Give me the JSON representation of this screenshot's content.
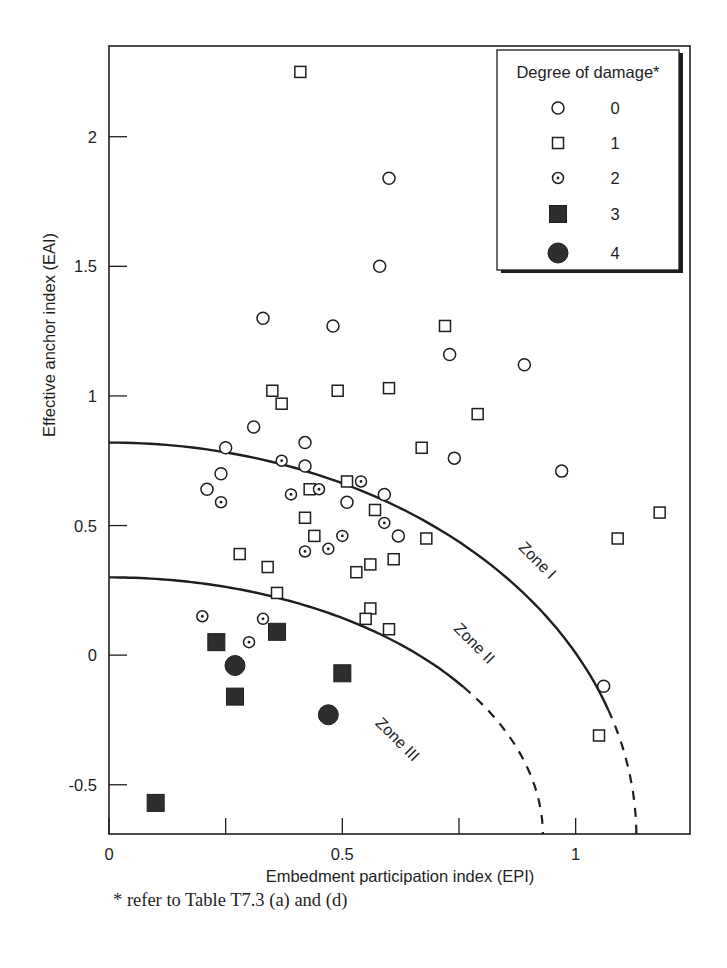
{
  "chart_data": {
    "type": "scatter",
    "title": "",
    "xlabel": "Embedment participation index (EPI)",
    "ylabel": "Effective anchor index (EAI)",
    "xlim": [
      0,
      1.245
    ],
    "ylim": [
      -0.69,
      2.35
    ],
    "xticks": [
      0,
      0.25,
      0.5,
      0.75,
      1
    ],
    "xtick_labels": [
      "0",
      "",
      "0.5",
      "",
      "1"
    ],
    "yticks": [
      -0.5,
      0,
      0.5,
      1,
      1.5,
      2
    ],
    "ytick_labels": [
      "-0.5",
      "0",
      "0.5",
      "1",
      "1.5",
      "2"
    ],
    "grid": false,
    "legend": {
      "title": "Degree of damage*",
      "placement": "top-right",
      "entries": [
        {
          "label": "0",
          "marker": "open-circle"
        },
        {
          "label": "1",
          "marker": "open-square"
        },
        {
          "label": "2",
          "marker": "dotted-circle"
        },
        {
          "label": "3",
          "marker": "filled-square"
        },
        {
          "label": "4",
          "marker": "filled-circle"
        }
      ]
    },
    "series": [
      {
        "name": "0",
        "marker": "open-circle",
        "points": [
          [
            0.6,
            1.84
          ],
          [
            0.58,
            1.5
          ],
          [
            0.33,
            1.3
          ],
          [
            0.48,
            1.27
          ],
          [
            0.73,
            1.16
          ],
          [
            0.89,
            1.12
          ],
          [
            0.31,
            0.88
          ],
          [
            0.42,
            0.82
          ],
          [
            0.25,
            0.8
          ],
          [
            0.42,
            0.73
          ],
          [
            0.74,
            0.76
          ],
          [
            0.97,
            0.71
          ],
          [
            0.24,
            0.7
          ],
          [
            0.21,
            0.64
          ],
          [
            0.59,
            0.62
          ],
          [
            0.51,
            0.59
          ],
          [
            0.62,
            0.46
          ],
          [
            1.06,
            -0.12
          ]
        ]
      },
      {
        "name": "1",
        "marker": "open-square",
        "points": [
          [
            0.41,
            2.25
          ],
          [
            0.72,
            1.27
          ],
          [
            0.6,
            1.03
          ],
          [
            0.35,
            1.02
          ],
          [
            0.49,
            1.02
          ],
          [
            0.37,
            0.97
          ],
          [
            0.79,
            0.93
          ],
          [
            0.67,
            0.8
          ],
          [
            0.51,
            0.67
          ],
          [
            0.43,
            0.64
          ],
          [
            0.57,
            0.56
          ],
          [
            1.18,
            0.55
          ],
          [
            0.42,
            0.53
          ],
          [
            0.44,
            0.46
          ],
          [
            0.68,
            0.45
          ],
          [
            1.09,
            0.45
          ],
          [
            0.28,
            0.39
          ],
          [
            0.61,
            0.37
          ],
          [
            0.56,
            0.35
          ],
          [
            0.34,
            0.34
          ],
          [
            0.53,
            0.32
          ],
          [
            0.36,
            0.24
          ],
          [
            0.56,
            0.18
          ],
          [
            0.55,
            0.14
          ],
          [
            0.6,
            0.1
          ],
          [
            1.05,
            -0.31
          ]
        ]
      },
      {
        "name": "2",
        "marker": "dotted-circle",
        "points": [
          [
            0.37,
            0.75
          ],
          [
            0.54,
            0.67
          ],
          [
            0.39,
            0.62
          ],
          [
            0.45,
            0.64
          ],
          [
            0.24,
            0.59
          ],
          [
            0.59,
            0.51
          ],
          [
            0.5,
            0.46
          ],
          [
            0.47,
            0.41
          ],
          [
            0.42,
            0.4
          ],
          [
            0.2,
            0.15
          ],
          [
            0.33,
            0.14
          ],
          [
            0.3,
            0.05
          ]
        ]
      },
      {
        "name": "3",
        "marker": "filled-square",
        "points": [
          [
            0.36,
            0.09
          ],
          [
            0.23,
            0.05
          ],
          [
            0.5,
            -0.07
          ],
          [
            0.27,
            -0.16
          ],
          [
            0.1,
            -0.57
          ]
        ]
      },
      {
        "name": "4",
        "marker": "filled-circle",
        "points": [
          [
            0.27,
            -0.04
          ],
          [
            0.47,
            -0.23
          ]
        ]
      }
    ],
    "curves": [
      {
        "name": "zone-I-boundary",
        "shape": "quarter-ellipse",
        "center": [
          0,
          -0.7
        ],
        "x_radius": 1.13,
        "y_radius": 1.52,
        "y_intercept": 0.82,
        "solid_until_x": 1.07,
        "dashed_after": true
      },
      {
        "name": "zone-II-boundary",
        "shape": "quarter-ellipse",
        "center": [
          0,
          -0.7
        ],
        "x_radius": 0.93,
        "y_radius": 1.0,
        "y_intercept": 0.3,
        "solid_until_x": 0.76,
        "dashed_after": true
      }
    ],
    "annotations": [
      {
        "text": "Zone I",
        "x": 0.91,
        "y": 0.37,
        "rotation_deg": 45
      },
      {
        "text": "Zone II",
        "x": 0.775,
        "y": 0.05,
        "rotation_deg": 45
      },
      {
        "text": "Zone III",
        "x": 0.61,
        "y": -0.32,
        "rotation_deg": 45
      }
    ]
  },
  "footnote": "* refer to Table T7.3 (a) and (d)",
  "colors": {
    "ink": "#1e1e1e",
    "fill_dark": "#2e2e2e",
    "background": "#ffffff"
  }
}
